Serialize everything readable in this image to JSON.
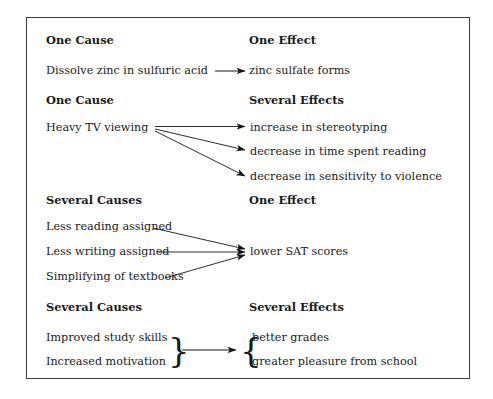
{
  "diagram": {
    "title_visible": false,
    "border_color": "#3a3a3a",
    "text_color": "#1a1a1a",
    "background": "#ffffff",
    "sections": [
      {
        "name": "one-cause-one-effect",
        "cause_heading": "One Cause",
        "effect_heading": "One Effect",
        "causes": [
          "Dissolve zinc in sulfuric acid"
        ],
        "effects": [
          "zinc sulfate forms"
        ],
        "connector": "single-arrow"
      },
      {
        "name": "one-cause-several-effects",
        "cause_heading": "One Cause",
        "effect_heading": "Several Effects",
        "causes": [
          "Heavy TV viewing"
        ],
        "effects": [
          "increase in stereotyping",
          "decrease in time spent reading",
          "decrease in sensitivity to violence"
        ],
        "connector": "fan-out-arrows"
      },
      {
        "name": "several-causes-one-effect",
        "cause_heading": "Several Causes",
        "effect_heading": "One Effect",
        "causes": [
          "Less reading assigned",
          "Less writing assigned",
          "Simplifying of textbooks"
        ],
        "effects": [
          "lower SAT scores"
        ],
        "connector": "converging-arrows"
      },
      {
        "name": "several-causes-several-effects",
        "cause_heading": "Several Causes",
        "effect_heading": "Several Effects",
        "causes": [
          "Improved study skills",
          "Increased motivation"
        ],
        "effects": [
          "better grades",
          "greater pleasure from school"
        ],
        "connector": "brace-arrow-brace",
        "left_brace": "}",
        "right_brace": "{"
      }
    ]
  }
}
